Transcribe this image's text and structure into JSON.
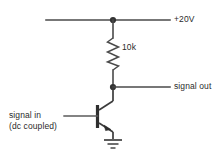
{
  "diagram": {
    "type": "schematic",
    "background_color": "#ffffff",
    "line_color": "#4a4a4a",
    "text_color": "#2b2b2b"
  },
  "labels": {
    "supply": "+20V",
    "resistor": "10k",
    "signal_out": "signal out",
    "signal_in_line1": "signal in",
    "signal_in_line2": "(dc coupled)"
  },
  "components": [
    {
      "id": "supply-rail",
      "name": "supply-rail",
      "kind": "wire",
      "label": "+20V"
    },
    {
      "id": "collector-resistor",
      "name": "collector-resistor",
      "kind": "resistor",
      "label": "10k",
      "value": "10k"
    },
    {
      "id": "npn-transistor",
      "name": "npn-transistor",
      "kind": "transistor",
      "polarity": "NPN",
      "label": ""
    },
    {
      "id": "output-node",
      "name": "output-node",
      "kind": "junction",
      "label": "signal out"
    },
    {
      "id": "input-node",
      "name": "input-node",
      "kind": "terminal",
      "label": "signal in (dc coupled)"
    },
    {
      "id": "ground-symbol",
      "name": "ground-symbol",
      "kind": "ground",
      "label": ""
    }
  ],
  "nodes": [
    {
      "id": "supply-junction",
      "x": 113,
      "y": 20
    },
    {
      "id": "output-junction",
      "x": 113,
      "y": 87
    }
  ]
}
